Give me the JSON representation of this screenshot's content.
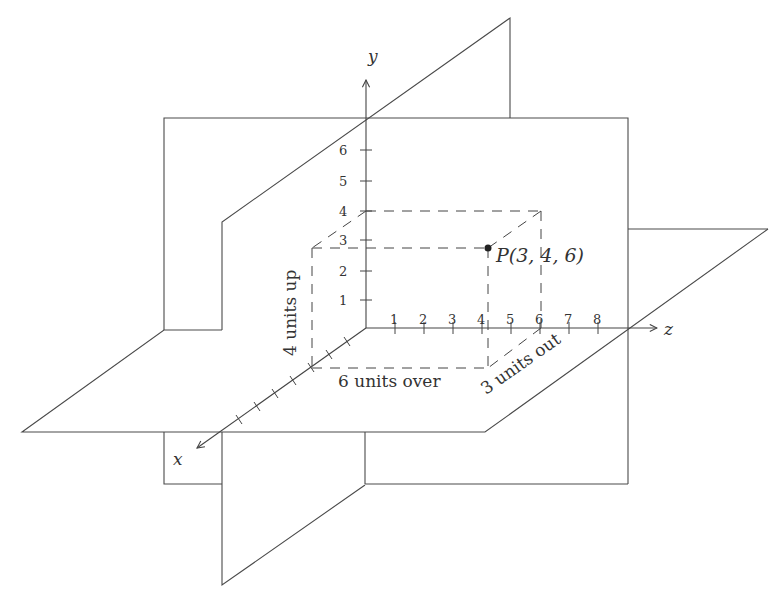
{
  "diagram": {
    "colors": {
      "line": "#4a4a4a",
      "text": "#333333",
      "background": "#ffffff"
    },
    "axes": {
      "x": {
        "label": "x",
        "ticks": 6
      },
      "y": {
        "label": "y",
        "tick_labels": [
          "1",
          "2",
          "3",
          "4",
          "5",
          "6"
        ]
      },
      "z": {
        "label": "z",
        "tick_labels": [
          "1",
          "2",
          "3",
          "4",
          "5",
          "6",
          "7",
          "8"
        ]
      }
    },
    "point": {
      "label": "P(3, 4, 6)",
      "x": 3,
      "y": 4,
      "z": 6
    },
    "annotations": {
      "up": "4 units up",
      "over": "6 units over",
      "out": "3 units out"
    },
    "planes": [
      "xy-plane",
      "yz-plane",
      "xz-plane"
    ]
  }
}
